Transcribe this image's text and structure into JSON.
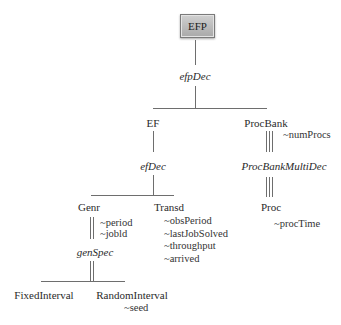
{
  "diagram": {
    "root": {
      "label": "EFP",
      "fill": "#bdbdbd"
    },
    "decompositions": {
      "efpDec": "efpDec",
      "efDec": "efDec",
      "procBankMultiDec": "ProcBankMultiDec",
      "genSpec": "genSpec"
    },
    "nodes": {
      "ef": "EF",
      "procBank": "ProcBank",
      "genr": "Genr",
      "transd": "Transd",
      "proc": "Proc",
      "fixedInterval": "FixedInterval",
      "randomInterval": "RandomInterval"
    },
    "variables": {
      "procBank": [
        "~numProcs"
      ],
      "genr": [
        "~period",
        "~jobld"
      ],
      "transd": [
        "~obsPeriod",
        "~lastJobSolved",
        "~throughput",
        "~arrived"
      ],
      "proc": [
        "~procTime"
      ],
      "randomInterval": [
        "~seed"
      ]
    },
    "line_color": "#6e6e6e"
  }
}
